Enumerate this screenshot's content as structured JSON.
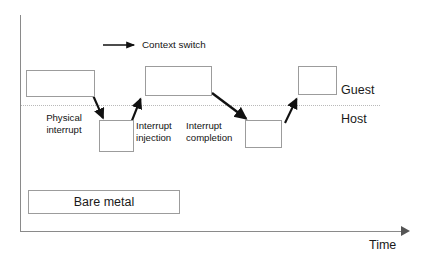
{
  "diagram": {
    "legend": {
      "arrow_icon": "context-switch-arrow-icon",
      "label": "Context switch"
    },
    "lanes": [
      {
        "id": "guest",
        "label": "Guest"
      },
      {
        "id": "host",
        "label": "Host"
      }
    ],
    "axes": {
      "x_label": "Time",
      "y_label": ""
    },
    "boxes": [
      {
        "id": "guest-run-1",
        "lane": "guest",
        "label": "",
        "x": 26,
        "y": 70,
        "w": 69,
        "h": 27
      },
      {
        "id": "host-run-1",
        "lane": "host",
        "label": "",
        "x": 99,
        "y": 120,
        "w": 35,
        "h": 32
      },
      {
        "id": "guest-run-2",
        "lane": "guest",
        "label": "",
        "x": 145,
        "y": 66,
        "w": 67,
        "h": 30
      },
      {
        "id": "host-run-2",
        "lane": "host",
        "label": "",
        "x": 245,
        "y": 120,
        "w": 37,
        "h": 28
      },
      {
        "id": "guest-run-3",
        "lane": "guest",
        "label": "",
        "x": 298,
        "y": 66,
        "w": 39,
        "h": 29
      },
      {
        "id": "bare-metal",
        "lane": "bare",
        "label": "Bare metal",
        "x": 28,
        "y": 190,
        "w": 152,
        "h": 24
      }
    ],
    "annotations": [
      {
        "id": "physical-interrupt",
        "text": "Physical\ninterrupt",
        "x": 33,
        "y": 113
      },
      {
        "id": "interrupt-injection",
        "text": "Interrupt\ninjection",
        "x": 136,
        "y": 120
      },
      {
        "id": "interrupt-completion",
        "text": "Interrupt\ncompletion",
        "x": 186,
        "y": 120
      }
    ],
    "arrows": [
      {
        "id": "context-switch-1",
        "from": [
          92,
          93
        ],
        "to": [
          104,
          121
        ],
        "direction": "guest-to-host"
      },
      {
        "id": "context-switch-2",
        "from": [
          131,
          123
        ],
        "to": [
          141,
          96
        ],
        "direction": "host-to-guest"
      },
      {
        "id": "context-switch-3",
        "from": [
          212,
          93
        ],
        "to": [
          248,
          121
        ],
        "direction": "guest-to-host"
      },
      {
        "id": "context-switch-4",
        "from": [
          285,
          123
        ],
        "to": [
          297,
          96
        ],
        "direction": "host-to-guest"
      }
    ],
    "colors": {
      "background": "#ffffff",
      "box_border": "#9c9c9c",
      "axis": "#8a8a8a",
      "divider": "#b9b9b9",
      "text": "#131313",
      "arrow": "#111111"
    }
  }
}
